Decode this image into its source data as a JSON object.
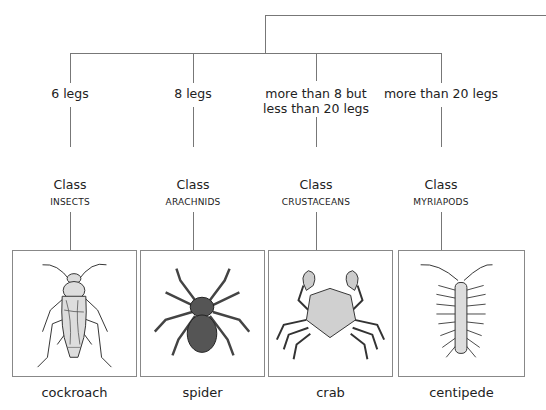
{
  "diagram": {
    "type": "classification-tree",
    "branches": [
      {
        "criterion": "6 legs",
        "class_label": "Class",
        "class_name": "INSECTS",
        "example": "cockroach",
        "icon": "cockroach-icon"
      },
      {
        "criterion": "8 legs",
        "class_label": "Class",
        "class_name": "ARACHNIDS",
        "example": "spider",
        "icon": "spider-icon"
      },
      {
        "criterion": "more than 8 but less than 20 legs",
        "criterion_lines": [
          "more than 8 but",
          "less than 20 legs"
        ],
        "class_label": "Class",
        "class_name": "CRUSTACEANS",
        "example": "crab",
        "icon": "crab-icon"
      },
      {
        "criterion": "more than 20 legs",
        "class_label": "Class",
        "class_name": "MYRIAPODS",
        "example": "centipede",
        "icon": "centipede-icon"
      }
    ],
    "colors": {
      "line": "#777777",
      "text": "#222222",
      "fill_light": "#d0d0d0",
      "fill_dark": "#555555"
    }
  }
}
